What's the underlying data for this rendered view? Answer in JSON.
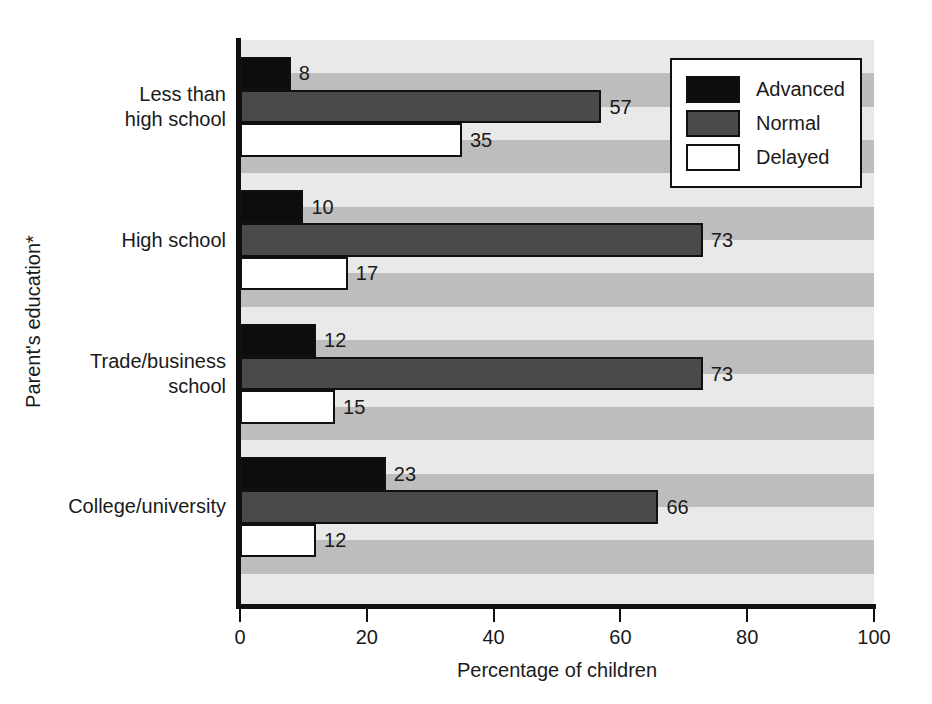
{
  "chart_data": {
    "type": "bar",
    "orientation": "horizontal",
    "title": "",
    "xlabel": "Percentage of children",
    "ylabel": "Parent's education*",
    "xlim": [
      0,
      100
    ],
    "xticks": [
      0,
      20,
      40,
      60,
      80,
      100
    ],
    "xtick_labels": [
      "0",
      "20",
      "40",
      "60",
      "80",
      "100"
    ],
    "grid": false,
    "background_bands": true,
    "legend_position": "top-right",
    "categories": [
      "Less than\nhigh school",
      "High school",
      "Trade/business\nschool",
      "College/university"
    ],
    "category_lines": [
      [
        "Less than",
        "high school"
      ],
      [
        "High school"
      ],
      [
        "Trade/business",
        "school"
      ],
      [
        "College/university"
      ]
    ],
    "series": [
      {
        "name": "Advanced",
        "color": "#0d0d0d",
        "values": [
          8,
          10,
          12,
          23
        ]
      },
      {
        "name": "Normal",
        "color": "#4a4a4a",
        "values": [
          57,
          73,
          73,
          66
        ]
      },
      {
        "name": "Delayed",
        "color": "#ffffff",
        "values": [
          35,
          17,
          15,
          12
        ]
      }
    ],
    "data_labels": [
      [
        "8",
        "57",
        "35"
      ],
      [
        "10",
        "73",
        "17"
      ],
      [
        "12",
        "73",
        "15"
      ],
      [
        "23",
        "66",
        "12"
      ]
    ]
  },
  "axes": {
    "x_title": "Percentage of children",
    "y_title": "Parent's education*",
    "x_tick_labels": [
      "0",
      "20",
      "40",
      "60",
      "80",
      "100"
    ]
  },
  "legend": {
    "items": [
      {
        "label": "Advanced",
        "swatch": "advanced"
      },
      {
        "label": "Normal",
        "swatch": "normal"
      },
      {
        "label": "Delayed",
        "swatch": "delayed"
      }
    ]
  },
  "colors": {
    "advanced": "#0d0d0d",
    "normal": "#4a4a4a",
    "delayed": "#ffffff",
    "band_light": "#e9e9e9",
    "band_dark": "#bdbdbd",
    "axis": "#101010"
  }
}
